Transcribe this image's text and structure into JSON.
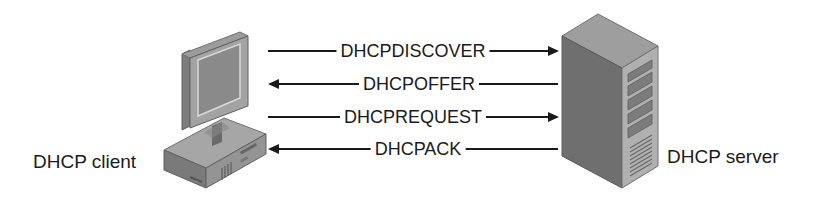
{
  "diagram": {
    "client": {
      "label": "DHCP client",
      "icon": "desktop-computer-icon"
    },
    "server": {
      "label": "DHCP server",
      "icon": "server-tower-icon"
    },
    "messages": [
      {
        "label": "DHCPDISCOVER",
        "direction": "client-to-server"
      },
      {
        "label": "DHCPOFFER",
        "direction": "server-to-client"
      },
      {
        "label": "DHCPREQUEST",
        "direction": "client-to-server"
      },
      {
        "label": "DHCPACK",
        "direction": "server-to-client"
      }
    ],
    "colors": {
      "line": "#1a1a1a",
      "device_dark": "#6e6e6e",
      "device_mid": "#8c8c8c",
      "device_light": "#b4b4b4"
    }
  }
}
